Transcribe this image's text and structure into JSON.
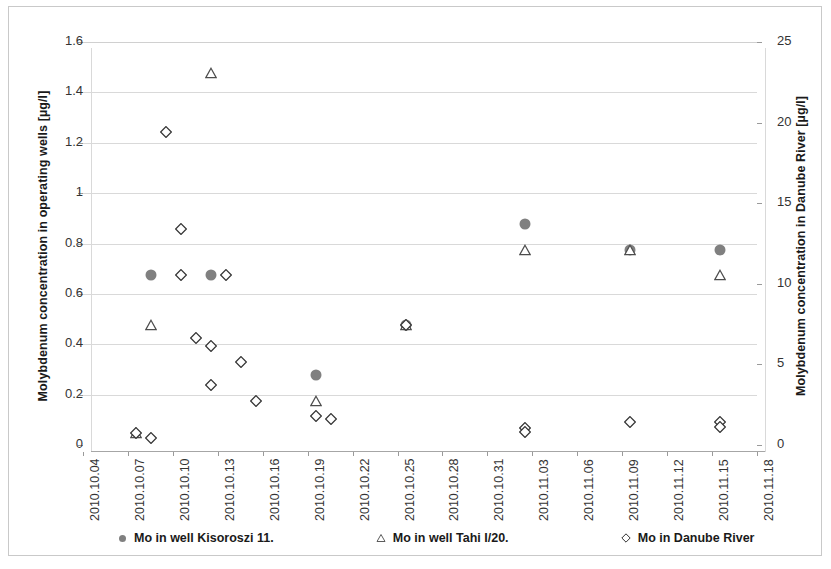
{
  "chart_data": {
    "type": "scatter",
    "title": "",
    "xlabel": "",
    "ylabel": "Molybdenum concentration in operating wells [µg/l]",
    "y2label": "Molybdenum concentration in Danube River [µg/l]",
    "grid": true,
    "legend_position": "bottom",
    "xlim": [
      "2010.10.04",
      "2010.11.18"
    ],
    "ylim": [
      0,
      1.6
    ],
    "y2lim": [
      0,
      25
    ],
    "xticklabels": [
      "2010.10.04",
      "2010.10.07",
      "2010.10.10",
      "2010.10.13",
      "2010.10.16",
      "2010.10.19",
      "2010.10.22",
      "2010.10.25",
      "2010.10.28",
      "2010.10.31",
      "2010.11.03",
      "2010.11.06",
      "2010.11.09",
      "2010.11.12",
      "2010.11.15",
      "2010.11.18"
    ],
    "yticklabels": [
      "0",
      "0.2",
      "0.4",
      "0.6",
      "0.8",
      "1",
      "1.2",
      "1.4",
      "1.6"
    ],
    "yticks": [
      0,
      0.2,
      0.4,
      0.6,
      0.8,
      1,
      1.2,
      1.4,
      1.6
    ],
    "y2ticklabels": [
      "0",
      "5",
      "10",
      "15",
      "20",
      "25"
    ],
    "y2ticks": [
      0,
      5,
      10,
      15,
      20,
      25
    ],
    "series": [
      {
        "name": "Mo in well Kisoroszi 11.",
        "marker": "filled-circle",
        "color": "#808080",
        "axis": "left",
        "points": [
          {
            "x": "2010.10.08",
            "y": 0.7
          },
          {
            "x": "2010.10.12",
            "y": 0.7
          },
          {
            "x": "2010.10.19",
            "y": 0.3
          },
          {
            "x": "2010.10.25",
            "y": 0.5
          },
          {
            "x": "2010.11.02",
            "y": 0.9
          },
          {
            "x": "2010.11.09",
            "y": 0.8
          },
          {
            "x": "2010.11.15",
            "y": 0.8
          }
        ]
      },
      {
        "name": "Mo in well Tahi I/20.",
        "marker": "open-triangle",
        "color": "#4d4d4d",
        "axis": "left",
        "points": [
          {
            "x": "2010.10.07",
            "y": 0.07
          },
          {
            "x": "2010.10.08",
            "y": 0.5
          },
          {
            "x": "2010.10.12",
            "y": 1.5
          },
          {
            "x": "2010.10.19",
            "y": 0.2
          },
          {
            "x": "2010.10.25",
            "y": 0.5
          },
          {
            "x": "2010.11.02",
            "y": 0.8
          },
          {
            "x": "2010.11.09",
            "y": 0.8
          },
          {
            "x": "2010.11.15",
            "y": 0.7
          }
        ]
      },
      {
        "name": "Mo in Danube River",
        "marker": "open-diamond",
        "color": "#333333",
        "axis": "right",
        "points": [
          {
            "x": "2010.10.07",
            "y": 1.1
          },
          {
            "x": "2010.10.08",
            "y": 0.8
          },
          {
            "x": "2010.10.09",
            "y": 19.8
          },
          {
            "x": "2010.10.10",
            "y": 13.8
          },
          {
            "x": "2010.10.10",
            "y": 10.9
          },
          {
            "x": "2010.10.11",
            "y": 7.0
          },
          {
            "x": "2010.10.12",
            "y": 6.5
          },
          {
            "x": "2010.10.12",
            "y": 4.1
          },
          {
            "x": "2010.10.13",
            "y": 10.9
          },
          {
            "x": "2010.10.14",
            "y": 5.5
          },
          {
            "x": "2010.10.15",
            "y": 3.1
          },
          {
            "x": "2010.10.19",
            "y": 2.2
          },
          {
            "x": "2010.10.20",
            "y": 2.0
          },
          {
            "x": "2010.10.25",
            "y": 7.8
          },
          {
            "x": "2010.11.02",
            "y": 1.4
          },
          {
            "x": "2010.11.02",
            "y": 1.2
          },
          {
            "x": "2010.11.09",
            "y": 1.8
          },
          {
            "x": "2010.11.15",
            "y": 1.8
          },
          {
            "x": "2010.11.15",
            "y": 1.5
          }
        ]
      }
    ]
  },
  "legend": {
    "items": [
      {
        "label": "Mo in well Kisoroszi 11.",
        "marker": "filled-circle"
      },
      {
        "label": "Mo in well Tahi I/20.",
        "marker": "open-triangle"
      },
      {
        "label": "Mo in Danube River",
        "marker": "open-diamond"
      }
    ]
  }
}
